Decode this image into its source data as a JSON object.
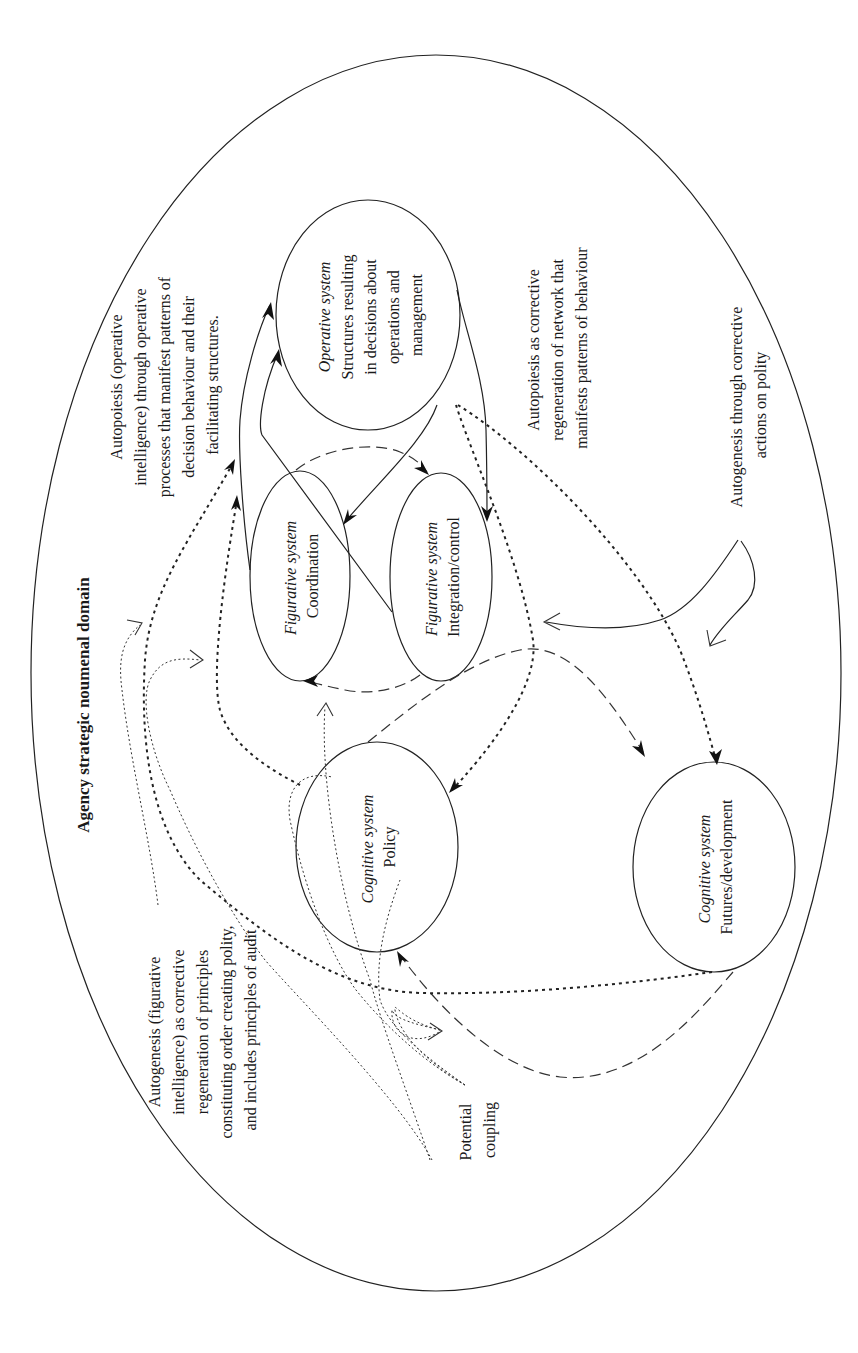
{
  "title": "Agency strategic noumenal domain",
  "nodes": {
    "operative": {
      "type_label": "Operative system",
      "lines": [
        "Structures resulting",
        "in decisions about",
        "operations and",
        "management"
      ]
    },
    "coordination": {
      "type_label": "Figurative system",
      "name": "Coordination"
    },
    "integration": {
      "type_label": "Figurative system",
      "name": "Integration/control"
    },
    "policy": {
      "type_label": "Cognitive system",
      "name": "Policy"
    },
    "futures": {
      "type_label": "Cognitive system",
      "name": "Futures/development"
    }
  },
  "annotations": {
    "autopoiesis_operative": {
      "lines": [
        "Autopoiesis (operative",
        "intelligence) through operative",
        "processes that manifest patterns of",
        "decision behaviour and their",
        "facilitating structures."
      ]
    },
    "autopoiesis_corrective": {
      "lines": [
        "Autopoiesis as corrective",
        "regeneration of network that",
        "manifests patterns of behaviour"
      ]
    },
    "autogenesis_polity": {
      "lines": [
        "Autogenesis through corrective",
        "actions on polity"
      ]
    },
    "autogenesis_figurative": {
      "lines": [
        "Autogenesis (figurative",
        "intelligence) as corrective",
        "regeneration of principles",
        "constituting order creating polity,",
        "and includes principles of audit"
      ]
    },
    "potential_coupling": {
      "lines": [
        "Potential",
        "coupling"
      ]
    }
  },
  "legend_line_styles": {
    "solid": "operative flows",
    "dashed": "figurative flows",
    "dotted": "cognitive flows",
    "fine_dotted": "potential coupling"
  }
}
